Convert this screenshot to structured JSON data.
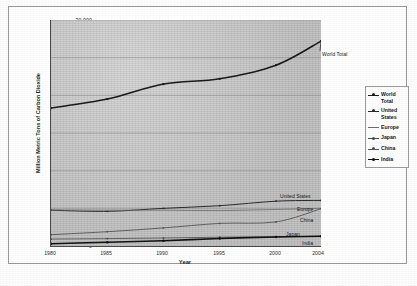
{
  "chart_data": {
    "type": "line",
    "title": "",
    "xlabel": "Year",
    "ylabel": "Million Metric Tons of Carbon Dioxide",
    "x": [
      1980,
      1985,
      1990,
      1995,
      2000,
      2004
    ],
    "xtick_labels": [
      "1980",
      "1985",
      "1990",
      "1995",
      "2000",
      "2004"
    ],
    "ytick_labels": [
      "0",
      "5,000",
      "10,000",
      "15,000",
      "20,000",
      "25,000",
      "30,000"
    ],
    "yticks": [
      0,
      5000,
      10000,
      15000,
      20000,
      25000,
      30000
    ],
    "ylim": [
      0,
      30000
    ],
    "xlim": [
      1980,
      2004
    ],
    "grid": "horizontal",
    "legend_position": "right",
    "plot_background": "#c9c9c9",
    "series": [
      {
        "name": "World Total",
        "color": "#1a1a1a",
        "width": 1.5,
        "marker": true,
        "values": [
          18300,
          19500,
          21500,
          22200,
          24000,
          27200
        ],
        "end_label": "World Total"
      },
      {
        "name": "United States",
        "color": "#2b2b2b",
        "width": 1.0,
        "marker": true,
        "values": [
          4750,
          4600,
          5000,
          5350,
          5950,
          6050
        ],
        "end_label": "United States"
      },
      {
        "name": "Europe",
        "color": "#6d6d6d",
        "width": 0.8,
        "marker": false,
        "values": [
          4800,
          4750,
          4750,
          4700,
          4850,
          5000
        ],
        "end_label": "Europe"
      },
      {
        "name": "Japan",
        "color": "#4a4a4a",
        "width": 0.8,
        "marker": true,
        "values": [
          920,
          980,
          1060,
          1170,
          1230,
          1290
        ],
        "end_label": "Japan"
      },
      {
        "name": "China",
        "color": "#555555",
        "width": 0.9,
        "marker": true,
        "values": [
          1500,
          1900,
          2400,
          3000,
          3200,
          4950
        ],
        "end_label": "China"
      },
      {
        "name": "India",
        "color": "#111111",
        "width": 1.6,
        "marker": true,
        "values": [
          300,
          500,
          700,
          1000,
          1200,
          1300
        ],
        "end_label": "India"
      }
    ]
  },
  "legend": {
    "items": [
      {
        "label": "World Total",
        "color": "#1a1a1a"
      },
      {
        "label": "United States",
        "color": "#2b2b2b"
      },
      {
        "label": "Europe",
        "color": "#6d6d6d"
      },
      {
        "label": "Japan",
        "color": "#4a4a4a"
      },
      {
        "label": "China",
        "color": "#555555"
      },
      {
        "label": "India",
        "color": "#111111"
      }
    ]
  }
}
